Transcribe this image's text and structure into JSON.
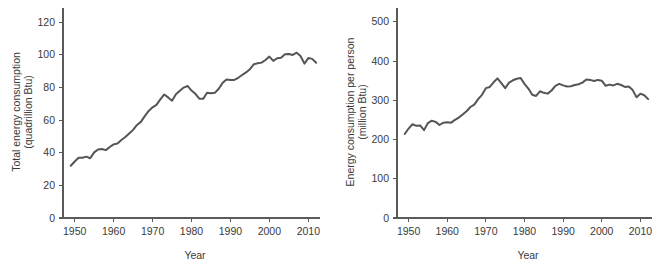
{
  "figure": {
    "background": "#ffffff",
    "line_color": "#555555",
    "axis_color": "#5a5a5a",
    "text_color": "#3a3a3a"
  },
  "chart_data": [
    {
      "type": "line",
      "panel": "left",
      "title": "",
      "xlabel": "Year",
      "ylabel": "Total energy consumption\n(quadrillion Btu)",
      "ylabel_line1": "Total energy consumption",
      "ylabel_line2": "(quadrillion Btu)",
      "xlim": [
        1947,
        2013
      ],
      "ylim": [
        0,
        125
      ],
      "xticks": [
        1950,
        1960,
        1970,
        1980,
        1990,
        2000,
        2010
      ],
      "xtick_labels": [
        "1950",
        "1960",
        "1970",
        "1980",
        "1990",
        "2000",
        "2010"
      ],
      "yticks": [
        0,
        20,
        40,
        60,
        80,
        100,
        120
      ],
      "ytick_labels": [
        "0",
        "20",
        "40",
        "60",
        "80",
        "100",
        "120"
      ],
      "grid": false,
      "legend": "none",
      "units": "quadrillion Btu",
      "x": [
        1949,
        1950,
        1951,
        1952,
        1953,
        1954,
        1955,
        1956,
        1957,
        1958,
        1959,
        1960,
        1961,
        1962,
        1963,
        1964,
        1965,
        1966,
        1967,
        1968,
        1969,
        1970,
        1971,
        1972,
        1973,
        1974,
        1975,
        1976,
        1977,
        1978,
        1979,
        1980,
        1981,
        1982,
        1983,
        1984,
        1985,
        1986,
        1987,
        1988,
        1989,
        1990,
        1991,
        1992,
        1993,
        1994,
        1995,
        1996,
        1997,
        1998,
        1999,
        2000,
        2001,
        2002,
        2003,
        2004,
        2005,
        2006,
        2007,
        2008,
        2009,
        2010,
        2011,
        2012
      ],
      "values": [
        32.0,
        34.6,
        36.9,
        36.9,
        37.6,
        36.6,
        40.2,
        42.0,
        42.3,
        41.6,
        43.5,
        45.1,
        45.7,
        47.8,
        49.6,
        51.8,
        54.0,
        57.0,
        58.9,
        62.4,
        65.6,
        67.8,
        69.3,
        72.7,
        75.7,
        73.9,
        71.9,
        75.8,
        77.9,
        79.9,
        80.9,
        78.1,
        76.1,
        73.1,
        73.0,
        76.7,
        76.4,
        76.7,
        79.2,
        82.8,
        84.9,
        84.6,
        84.6,
        85.9,
        87.6,
        89.2,
        91.2,
        94.2,
        94.8,
        95.2,
        96.8,
        98.9,
        96.3,
        97.9,
        98.2,
        100.3,
        100.5,
        99.9,
        101.3,
        99.3,
        94.6,
        98.0,
        97.5,
        95.1
      ]
    },
    {
      "type": "line",
      "panel": "right",
      "title": "",
      "xlabel": "Year",
      "ylabel": "Energy consumption per person\n(million Btu)",
      "ylabel_line1": "Energy consumption per person",
      "ylabel_line2": "(million Btu)",
      "xlim": [
        1947,
        2013
      ],
      "ylim": [
        0,
        520
      ],
      "xticks": [
        1950,
        1960,
        1970,
        1980,
        1990,
        2000,
        2010
      ],
      "xtick_labels": [
        "1950",
        "1960",
        "1970",
        "1980",
        "1990",
        "2000",
        "2010"
      ],
      "yticks": [
        0,
        100,
        200,
        300,
        400,
        500
      ],
      "ytick_labels": [
        "0",
        "100",
        "200",
        "300",
        "400",
        "500"
      ],
      "grid": false,
      "legend": "none",
      "units": "million Btu",
      "x": [
        1949,
        1950,
        1951,
        1952,
        1953,
        1954,
        1955,
        1956,
        1957,
        1958,
        1959,
        1960,
        1961,
        1962,
        1963,
        1964,
        1965,
        1966,
        1967,
        1968,
        1969,
        1970,
        1971,
        1972,
        1973,
        1974,
        1975,
        1976,
        1977,
        1978,
        1979,
        1980,
        1981,
        1982,
        1983,
        1984,
        1985,
        1986,
        1987,
        1988,
        1989,
        1990,
        1991,
        1992,
        1993,
        1994,
        1995,
        1996,
        1997,
        1998,
        1999,
        2000,
        2001,
        2002,
        2003,
        2004,
        2005,
        2006,
        2007,
        2008,
        2009,
        2010,
        2011,
        2012
      ],
      "values": [
        214,
        228,
        239,
        235,
        236,
        224,
        242,
        248,
        245,
        237,
        243,
        244,
        243,
        250,
        256,
        264,
        272,
        283,
        289,
        303,
        314,
        331,
        334,
        346,
        356,
        344,
        331,
        345,
        351,
        355,
        357,
        342,
        330,
        314,
        311,
        323,
        319,
        317,
        325,
        337,
        342,
        338,
        335,
        336,
        339,
        341,
        345,
        353,
        352,
        349,
        352,
        350,
        337,
        340,
        338,
        342,
        339,
        334,
        335,
        326,
        308,
        317,
        313,
        303
      ]
    }
  ]
}
